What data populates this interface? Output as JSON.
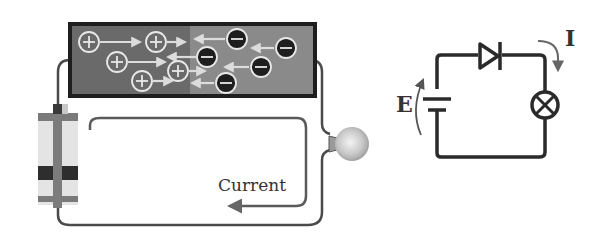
{
  "diagram": {
    "physical": {
      "current_label": "Current",
      "p_region": {
        "carrier": "hole",
        "symbol": "+",
        "color": "#6a6a6a",
        "carriers": [
          {
            "x": 89,
            "y": 42
          },
          {
            "x": 156,
            "y": 42
          },
          {
            "x": 117,
            "y": 62
          },
          {
            "x": 178,
            "y": 71
          },
          {
            "x": 142,
            "y": 81
          }
        ]
      },
      "n_region": {
        "carrier": "electron",
        "symbol": "−",
        "color": "#8a8a8a",
        "carriers": [
          {
            "x": 237,
            "y": 39
          },
          {
            "x": 286,
            "y": 48
          },
          {
            "x": 207,
            "y": 57
          },
          {
            "x": 261,
            "y": 67
          },
          {
            "x": 226,
            "y": 83
          }
        ]
      },
      "components": [
        "battery",
        "pn-junction",
        "light-bulb",
        "wires"
      ]
    },
    "schematic": {
      "emf_label": "E",
      "current_label": "I",
      "components": [
        "battery",
        "diode",
        "lamp"
      ]
    }
  }
}
